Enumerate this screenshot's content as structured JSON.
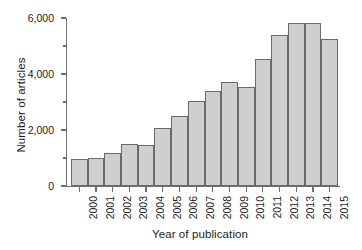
{
  "chart_data": {
    "type": "bar",
    "title": "",
    "xlabel": "Year of publication",
    "ylabel": "Number of articles",
    "categories": [
      "2000",
      "2001",
      "2002",
      "2003",
      "2004",
      "2005",
      "2006",
      "2007",
      "2008",
      "2009",
      "2010",
      "2011",
      "2012",
      "2013",
      "2014",
      "2015"
    ],
    "values": [
      950,
      990,
      1180,
      1500,
      1460,
      2080,
      2500,
      3050,
      3380,
      3700,
      3540,
      4520,
      5380,
      5820,
      5820,
      5260
    ],
    "ylim": [
      0,
      6000
    ],
    "ytick_values": [
      0,
      1000,
      2000,
      3000,
      4000,
      5000,
      6000
    ],
    "ytick_labels": [
      "0",
      "",
      "2,000",
      "",
      "4,000",
      "",
      "6,000"
    ],
    "ytick_major": [
      0,
      2000,
      4000,
      6000
    ],
    "ytick_minor": [
      1000,
      3000,
      5000
    ],
    "grid": false,
    "legend": null,
    "bar_fill_color": "#cfcfcf",
    "bar_edge_color": "#6a6a6a",
    "axis_color": "#6f6f6f",
    "text_color": "#1c1c1c",
    "background_color": "#ffffff"
  },
  "axes": {
    "y_title": "Number of articles",
    "x_title": "Year of publication",
    "y_labels": [
      "6,000",
      "4,000",
      "2,000",
      "0"
    ],
    "x_labels": [
      "2000",
      "2001",
      "2002",
      "2003",
      "2004",
      "2005",
      "2006",
      "2007",
      "2008",
      "2009",
      "2010",
      "2011",
      "2012",
      "2013",
      "2014",
      "2015"
    ]
  }
}
